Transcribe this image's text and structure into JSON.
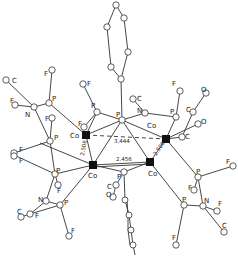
{
  "diagram": {
    "type": "crystal-structure-ortep",
    "labels": {
      "co": "Co",
      "p": "P",
      "f": "F",
      "n": "N",
      "c": "C",
      "o": "O"
    },
    "distances": {
      "co_co_long": "3.444",
      "co_co_short": "2.456",
      "co_co_left": "2.506",
      "co_co_right": "2.506"
    }
  }
}
